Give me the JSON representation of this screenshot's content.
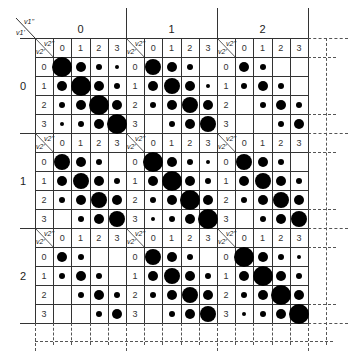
{
  "figure": {
    "outer_labels": {
      "corner_top": "v1''",
      "corner_bottom": "v1'",
      "columns": [
        "0",
        "1",
        "2"
      ],
      "rows": [
        "0",
        "1",
        "2"
      ]
    },
    "inner_labels": {
      "corner_top": "v2''",
      "corner_bottom": "v2'",
      "indices": [
        "0",
        "1",
        "2",
        "3"
      ]
    },
    "dot_size_legend": {
      "XL": 20,
      "L": 16,
      "M": 10,
      "S": 6,
      "XS": 4,
      "-": 0
    },
    "blocks": [
      [
        [
          [
            "XL",
            "M",
            "S",
            "XS"
          ],
          [
            "M",
            "XL",
            "M",
            "S"
          ],
          [
            "S",
            "M",
            "XL",
            "M"
          ],
          [
            "XS",
            "S",
            "M",
            "XL"
          ]
        ],
        [
          [
            "L",
            "M",
            "S",
            "-"
          ],
          [
            "M",
            "L",
            "M",
            "XS"
          ],
          [
            "S",
            "M",
            "L",
            "M"
          ],
          [
            "-",
            "S",
            "M",
            "L"
          ]
        ],
        [
          [
            "M",
            "S",
            "-",
            "-"
          ],
          [
            "S",
            "M",
            "S",
            "-"
          ],
          [
            "-",
            "S",
            "M",
            "S"
          ],
          [
            "-",
            "-",
            "S",
            "M"
          ]
        ]
      ],
      [
        [
          [
            "L",
            "M",
            "S",
            "-"
          ],
          [
            "M",
            "L",
            "M",
            "S"
          ],
          [
            "S",
            "M",
            "L",
            "M"
          ],
          [
            "-",
            "S",
            "M",
            "L"
          ]
        ],
        [
          [
            "XL",
            "M",
            "S",
            "XS"
          ],
          [
            "M",
            "XL",
            "M",
            "S"
          ],
          [
            "S",
            "M",
            "XL",
            "M"
          ],
          [
            "XS",
            "S",
            "M",
            "XL"
          ]
        ],
        [
          [
            "L",
            "M",
            "S",
            "-"
          ],
          [
            "M",
            "L",
            "M",
            "S"
          ],
          [
            "S",
            "M",
            "L",
            "M"
          ],
          [
            "-",
            "S",
            "M",
            "L"
          ]
        ]
      ],
      [
        [
          [
            "M",
            "S",
            "-",
            "-"
          ],
          [
            "S",
            "M",
            "S",
            "-"
          ],
          [
            "-",
            "S",
            "M",
            "S"
          ],
          [
            "-",
            "-",
            "S",
            "M"
          ]
        ],
        [
          [
            "L",
            "M",
            "S",
            "-"
          ],
          [
            "M",
            "L",
            "M",
            "S"
          ],
          [
            "S",
            "M",
            "L",
            "M"
          ],
          [
            "-",
            "S",
            "M",
            "L"
          ]
        ],
        [
          [
            "XL",
            "M",
            "S",
            "XS"
          ],
          [
            "M",
            "XL",
            "M",
            "S"
          ],
          [
            "S",
            "M",
            "XL",
            "M"
          ],
          [
            "XS",
            "S",
            "M",
            "XL"
          ]
        ]
      ]
    ]
  }
}
